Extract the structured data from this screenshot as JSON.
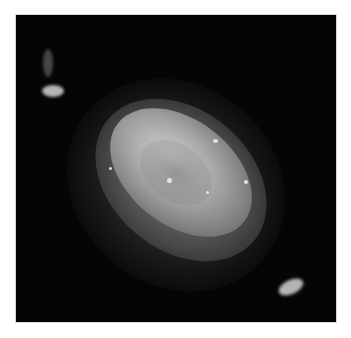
{
  "image": {
    "subject": "planetary nebula",
    "description": "Grayscale astronomical photograph of a planetary nebula with a bright elliptical inner shell, diffuse outer halo, and two ansae (bright knots) at opposite ends along the major axis",
    "colors": {
      "background": "#ffffff",
      "sky": "#050505",
      "nebula_core": "#d7d7d7",
      "nebula_halo": "#787878"
    }
  },
  "caption": {
    "text": ""
  }
}
